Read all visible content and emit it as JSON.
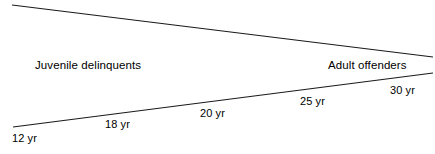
{
  "figure": {
    "type": "wedge-diagram",
    "background_color": "#ffffff",
    "line_color": "#1a1a1a",
    "width": 435,
    "height": 154,
    "groups": [
      {
        "id": "juvenile",
        "label": "Juvenile delinquents"
      },
      {
        "id": "adult",
        "label": "Adult offenders"
      }
    ],
    "age_markers": [
      {
        "id": "age-12",
        "label": "12 yr",
        "age": 12
      },
      {
        "id": "age-18",
        "label": "18 yr",
        "age": 18
      },
      {
        "id": "age-20",
        "label": "20 yr",
        "age": 20
      },
      {
        "id": "age-25",
        "label": "25 yr",
        "age": 25
      },
      {
        "id": "age-30",
        "label": "30 yr",
        "age": 30
      }
    ],
    "lines": {
      "upper": {
        "x1": 12,
        "y1": 5,
        "x2": 433,
        "y2": 57
      },
      "lower": {
        "x1": 13,
        "y1": 127,
        "x2": 433,
        "y2": 73
      }
    }
  }
}
